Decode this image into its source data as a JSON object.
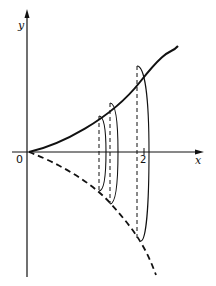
{
  "figure": {
    "axes": {
      "x_label": "x",
      "y_label": "y",
      "origin_label": "0",
      "tick_labels": [
        "2"
      ]
    },
    "curves": [
      {
        "name": "upper-curve",
        "style": "solid",
        "from": [
          0,
          0
        ],
        "to_x": 2.4
      },
      {
        "name": "mirror-curve",
        "style": "dashed",
        "from": [
          0,
          0
        ],
        "to_x": 2.1
      }
    ],
    "slices": [
      {
        "name": "slice-1",
        "x_px": 100
      },
      {
        "name": "slice-2",
        "x_px": 110
      },
      {
        "name": "slice-3",
        "x_px": 139
      }
    ],
    "colors": {
      "ink": "#111111",
      "background": "#ffffff"
    }
  }
}
